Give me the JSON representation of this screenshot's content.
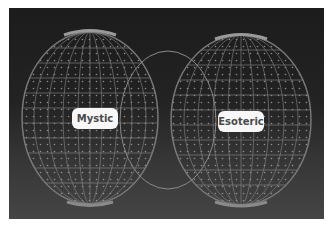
{
  "diagram": {
    "type": "venn-wireframe-spheres",
    "sets": [
      {
        "label": "Mystic",
        "position": "left"
      },
      {
        "label": "Esoteric",
        "position": "right"
      }
    ],
    "intersection": {
      "label": ""
    },
    "colors": {
      "background_top": "#1c1c1c",
      "background_bottom": "#454545",
      "wireframe": "#9a9a9a",
      "label_bg": "#f7f7f7",
      "label_text": "#4a4a4a"
    }
  }
}
